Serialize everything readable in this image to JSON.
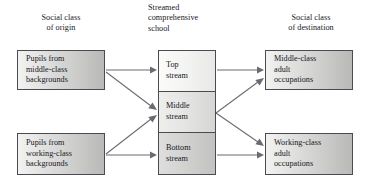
{
  "diagram": {
    "headings": {
      "origin": "Social class\nof origin",
      "school": "Streamed\ncomprehensive\nschool",
      "destination": "Social class\nof destination"
    },
    "nodes": {
      "origin_middle": "Pupils from\nmiddle-class\nbackgrounds",
      "origin_working": "Pupils from\nworking-class\nbackgrounds",
      "stream_top": "Top\nstream",
      "stream_middle": "Middle\nstream",
      "stream_bottom": "Bottom\nstream",
      "dest_middle": "Middle-class\nadult\noccupations",
      "dest_working": "Working-class\nadult\noccupations"
    },
    "colors": {
      "text": "#17171f",
      "box_border": "#4a4a52",
      "arrow": "#6a6a72",
      "background": "#ffffff"
    },
    "edges": [
      {
        "name": "origin-middle-to-top-stream",
        "from": "origin_middle",
        "to": "stream_top"
      },
      {
        "name": "origin-middle-to-middle-stream",
        "from": "origin_middle",
        "to": "stream_middle"
      },
      {
        "name": "origin-working-to-middle-stream",
        "from": "origin_working",
        "to": "stream_middle"
      },
      {
        "name": "origin-working-to-bottom-stream",
        "from": "origin_working",
        "to": "stream_bottom"
      },
      {
        "name": "top-stream-to-middle-class",
        "from": "stream_top",
        "to": "dest_middle"
      },
      {
        "name": "middle-stream-to-middle-class",
        "from": "stream_middle",
        "to": "dest_middle"
      },
      {
        "name": "middle-stream-to-working-class",
        "from": "stream_middle",
        "to": "dest_working"
      },
      {
        "name": "bottom-stream-to-working-class",
        "from": "stream_bottom",
        "to": "dest_working"
      }
    ]
  }
}
